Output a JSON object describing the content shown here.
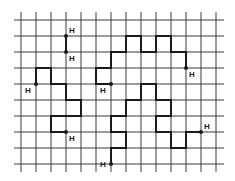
{
  "figure": {
    "grid": {
      "columns": 14,
      "rows": 10
    },
    "endpoint_label": "H",
    "colors": {
      "grid": "#3a3a3a",
      "path": "#1a1a1a",
      "background": "#ffffff"
    },
    "paths": [
      {
        "id": "path-a",
        "points": [
          [
            3,
            1
          ],
          [
            3,
            2
          ]
        ],
        "endpoints": [
          {
            "point": [
              3,
              1
            ],
            "label": "H",
            "label_side": "upper-right"
          },
          {
            "point": [
              3,
              2
            ],
            "label": "H",
            "label_side": "lower-right"
          }
        ]
      },
      {
        "id": "path-b",
        "points": [
          [
            1,
            4
          ],
          [
            1,
            3
          ],
          [
            2,
            3
          ],
          [
            2,
            4
          ],
          [
            3,
            4
          ],
          [
            3,
            5
          ],
          [
            4,
            5
          ],
          [
            4,
            6
          ],
          [
            2,
            6
          ],
          [
            2,
            7
          ],
          [
            3,
            7
          ]
        ],
        "endpoints": [
          {
            "point": [
              1,
              4
            ],
            "label": "H",
            "label_side": "lower-left"
          },
          {
            "point": [
              3,
              7
            ],
            "label": "H",
            "label_side": "lower-right"
          }
        ]
      },
      {
        "id": "path-c",
        "points": [
          [
            6,
            4
          ],
          [
            5,
            4
          ],
          [
            5,
            3
          ],
          [
            6,
            3
          ],
          [
            6,
            2
          ],
          [
            7,
            2
          ],
          [
            7,
            1
          ],
          [
            8,
            1
          ],
          [
            8,
            2
          ],
          [
            9,
            2
          ],
          [
            9,
            1
          ],
          [
            10,
            1
          ],
          [
            10,
            2
          ],
          [
            11,
            2
          ],
          [
            11,
            3
          ]
        ],
        "endpoints": [
          {
            "point": [
              6,
              4
            ],
            "label": "H",
            "label_side": "lower-left"
          },
          {
            "point": [
              11,
              3
            ],
            "label": "H",
            "label_side": "lower-right"
          }
        ]
      },
      {
        "id": "path-d",
        "points": [
          [
            6,
            9
          ],
          [
            6,
            8
          ],
          [
            7,
            8
          ],
          [
            7,
            7
          ],
          [
            6,
            7
          ],
          [
            6,
            6
          ],
          [
            7,
            6
          ],
          [
            7,
            5
          ],
          [
            8,
            5
          ],
          [
            8,
            4
          ],
          [
            9,
            4
          ],
          [
            9,
            5
          ],
          [
            10,
            5
          ],
          [
            10,
            6
          ],
          [
            9,
            6
          ],
          [
            9,
            7
          ],
          [
            10,
            7
          ],
          [
            10,
            8
          ],
          [
            11,
            8
          ],
          [
            11,
            7
          ],
          [
            12,
            7
          ]
        ],
        "endpoints": [
          {
            "point": [
              6,
              9
            ],
            "label": "H",
            "label_side": "left"
          },
          {
            "point": [
              12,
              7
            ],
            "label": "H",
            "label_side": "upper-right"
          }
        ]
      }
    ]
  }
}
